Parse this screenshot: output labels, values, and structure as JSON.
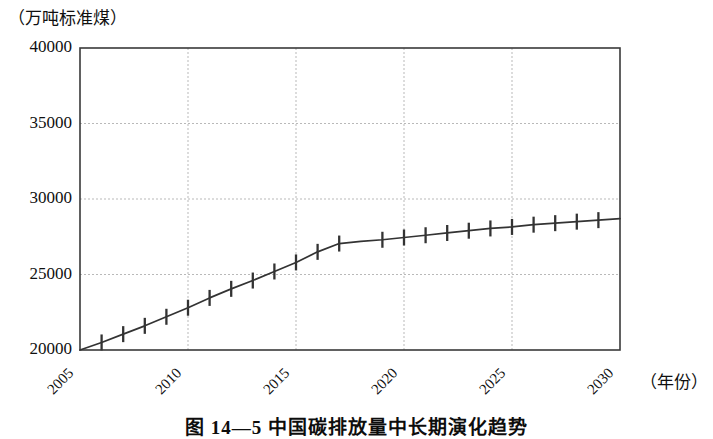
{
  "figure": {
    "caption": "图 14—5  中国碳排放量中长期演化趋势",
    "y_axis_unit": "（万吨标准煤）",
    "x_axis_unit": "（年份）"
  },
  "chart_data": {
    "type": "line",
    "title": "图 14—5  中国碳排放量中长期演化趋势",
    "xlabel": "（年份）",
    "ylabel": "（万吨标准煤）",
    "xlim": [
      2005,
      2030
    ],
    "ylim": [
      20000,
      40000
    ],
    "yticks": [
      20000,
      25000,
      30000,
      35000,
      40000
    ],
    "ytick_labels": [
      "20000",
      "25000",
      "30000",
      "35000",
      "40000"
    ],
    "xticks": [
      2005,
      2010,
      2015,
      2020,
      2025,
      2030
    ],
    "xtick_labels": [
      "2005",
      "2010",
      "2015",
      "2020",
      "2025",
      "2030"
    ],
    "grid": true,
    "grid_style": "dotted",
    "legend": null,
    "series": [
      {
        "name": "碳排放量",
        "marker": "vertical-bar",
        "color": "#333333",
        "x": [
          2005,
          2006,
          2007,
          2008,
          2009,
          2010,
          2011,
          2012,
          2013,
          2014,
          2015,
          2016,
          2017,
          2018,
          2019,
          2020,
          2021,
          2022,
          2023,
          2024,
          2025,
          2026,
          2027,
          2028,
          2029,
          2030
        ],
        "y": [
          20000,
          20500,
          21050,
          21600,
          22200,
          22800,
          23450,
          24050,
          24600,
          25200,
          25800,
          26500,
          27050,
          27200,
          27300,
          27450,
          27600,
          27750,
          27900,
          28050,
          28150,
          28300,
          28400,
          28500,
          28600,
          28700
        ],
        "marker_x": [
          2006,
          2007,
          2008,
          2009,
          2010,
          2011,
          2012,
          2013,
          2014,
          2015,
          2016,
          2017,
          2019,
          2020,
          2021,
          2022,
          2023,
          2024,
          2025,
          2026,
          2027,
          2028,
          2029
        ],
        "marker_y": [
          20500,
          21050,
          21600,
          22200,
          22800,
          23450,
          24050,
          24600,
          25200,
          25800,
          26500,
          27050,
          27300,
          27450,
          27600,
          27750,
          27900,
          28050,
          28150,
          28300,
          28400,
          28500,
          28600
        ]
      }
    ]
  }
}
